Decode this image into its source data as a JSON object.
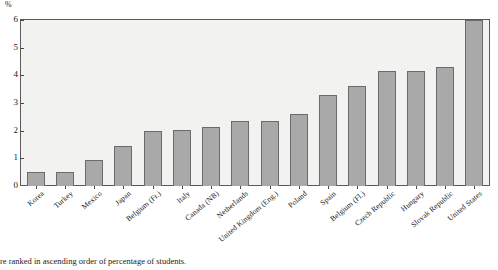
{
  "chart_data": {
    "type": "bar",
    "title": "",
    "subtitle": "",
    "xlabel": "",
    "ylabel": "%",
    "ylim": [
      0,
      6
    ],
    "yticks": [
      0,
      1,
      2,
      3,
      4,
      5,
      6
    ],
    "ytick_labels": [
      "0",
      "1",
      "2",
      "3",
      "4",
      "5",
      "6"
    ],
    "grid": false,
    "legend": null,
    "legend_position": "none",
    "bar_color": "#a9a9a9",
    "bar_edge_color": "#6b6b6b",
    "plot_background": "#f2f2f0",
    "categories": [
      "Korea",
      "Turkey",
      "Mexico",
      "Japan",
      "Belgium (Fr.)",
      "Italy",
      "Canada (NB)",
      "Netherlands",
      "United Kingdom (Eng.)",
      "Poland",
      "Spain",
      "Belgium (Fl.)",
      "Czech Republic",
      "Hungary",
      "Slovak Republic",
      "United States"
    ],
    "values": [
      0.5,
      0.5,
      0.95,
      1.45,
      1.98,
      2.02,
      2.15,
      2.35,
      2.35,
      2.6,
      3.3,
      3.6,
      4.15,
      4.15,
      4.3,
      6.0
    ]
  },
  "footnote": {
    "text": "re ranked in ascending order of percentage of students."
  },
  "axis": {
    "unit_label": "%"
  }
}
